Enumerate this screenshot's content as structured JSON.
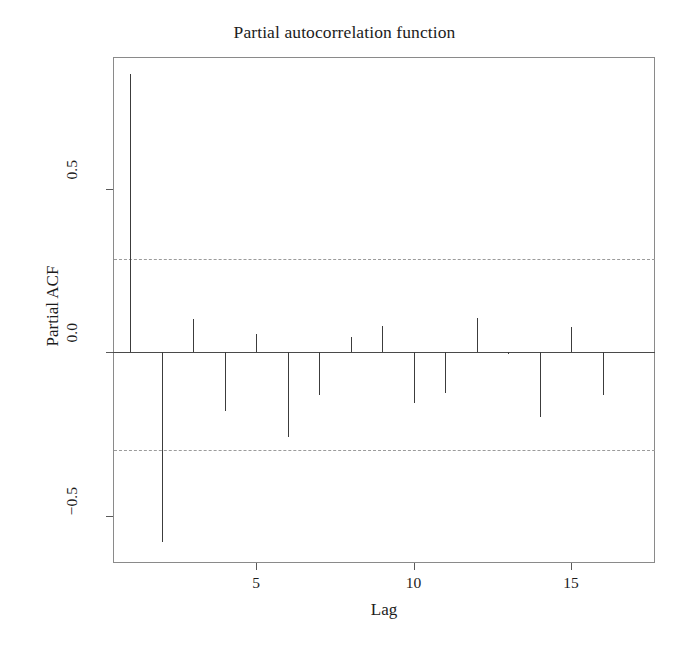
{
  "chart_data": {
    "type": "bar",
    "title": "Partial autocorrelation function",
    "xlabel": "Lag",
    "ylabel": "Partial ACF",
    "categories": [
      1,
      2,
      3,
      4,
      5,
      6,
      7,
      8,
      9,
      10,
      11,
      12,
      13,
      14,
      15,
      16
    ],
    "values": [
      0.85,
      -0.58,
      0.1,
      -0.18,
      0.055,
      -0.26,
      -0.13,
      0.045,
      0.08,
      -0.155,
      -0.125,
      0.105,
      -0.005,
      -0.2,
      0.075,
      -0.13
    ],
    "series": [
      {
        "name": "Partial ACF",
        "values": [
          0.85,
          -0.58,
          0.1,
          -0.18,
          0.055,
          -0.26,
          -0.13,
          0.045,
          0.08,
          -0.155,
          -0.125,
          0.105,
          -0.005,
          -0.2,
          0.075,
          -0.13
        ]
      }
    ],
    "confidence_bounds": [
      0.285,
      -0.3
    ],
    "xlim": [
      0.4,
      17.1
    ],
    "ylim": [
      -0.655,
      0.905
    ],
    "xticks": [
      5,
      10,
      15
    ],
    "xtick_labels": [
      "5",
      "10",
      "15"
    ],
    "yticks": [
      0.5,
      0.0,
      -0.5
    ],
    "ytick_labels": [
      "0.5",
      "0.0",
      "−0.5"
    ],
    "grid": false,
    "legend": "none",
    "zero_line": 0.0,
    "colors": {
      "stem": "#3c3c3c",
      "confidence_band": "#9b9b9b",
      "axis": "#5a5a5a",
      "box": "#8a8a8a",
      "text": "#1c1c1c",
      "background": "#ffffff"
    }
  }
}
